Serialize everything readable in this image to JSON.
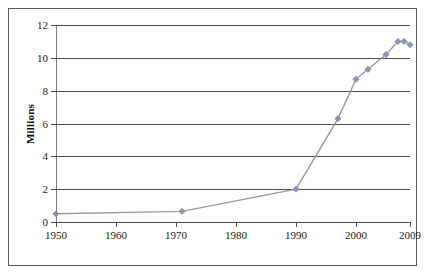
{
  "chart": {
    "ylabel": "Millions",
    "title": "",
    "y_ticks": [
      "0",
      "2",
      "4",
      "6",
      "8",
      "10",
      "12"
    ],
    "x_ticks": [
      "1950",
      "1960",
      "1970",
      "1980",
      "1990",
      "2000",
      "2009"
    ],
    "colors": {
      "series_line": "#9a9a9a",
      "marker": "#8497b0",
      "gridline": "#4d4d4d",
      "axis": "#808080",
      "frame": "#5a5a5a",
      "text": "#1a1a1a"
    }
  },
  "chart_data": {
    "type": "line",
    "title": "",
    "xlabel": "",
    "ylabel": "Millions",
    "xlim": [
      1950,
      2009
    ],
    "ylim": [
      0,
      12
    ],
    "x_tick_values": [
      1950,
      1960,
      1970,
      1980,
      1990,
      2000,
      2009
    ],
    "x_tick_labels": [
      "1950",
      "1960",
      "1970",
      "1980",
      "1990",
      "2000",
      "2009"
    ],
    "y_tick_values": [
      0,
      2,
      4,
      6,
      8,
      10,
      12
    ],
    "y_tick_labels": [
      "0",
      "2",
      "4",
      "6",
      "8",
      "10",
      "12"
    ],
    "grid": "horizontal",
    "legend": "none",
    "markers": "diamond",
    "series": [
      {
        "name": "Millions",
        "x": [
          1950,
          1971,
          1990,
          1997,
          2000,
          2002,
          2005,
          2007,
          2008,
          2009
        ],
        "values": [
          0.5,
          0.65,
          2.0,
          6.3,
          8.7,
          9.3,
          10.2,
          11.0,
          11.0,
          10.8
        ]
      }
    ]
  }
}
